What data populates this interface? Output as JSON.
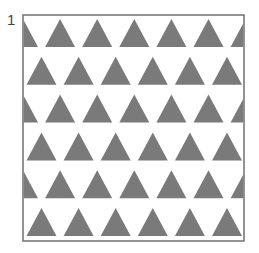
{
  "figure": {
    "label": "1",
    "frame": {
      "x": 23,
      "y": 15,
      "width": 221,
      "height": 226,
      "stroke": "#707070"
    },
    "pattern": {
      "shape": "triangle-up",
      "fill": "#7a7a7a",
      "rows": 6,
      "row_pitch": 37.8,
      "col_pitch": 37.1,
      "triangle_width": 30,
      "triangle_height": 28,
      "first_row_apex_y": 19,
      "even_row_first_apex_x": 41.5,
      "odd_row_first_apex_x": 23,
      "row_offsets": [
        "shifted",
        "aligned",
        "shifted",
        "aligned",
        "shifted",
        "aligned"
      ]
    }
  }
}
